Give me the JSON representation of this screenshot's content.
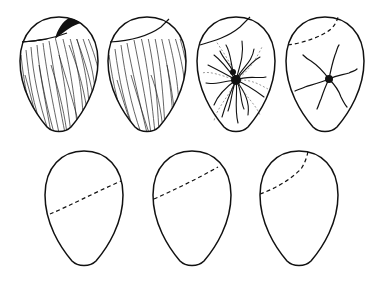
{
  "figure": {
    "stroke_color": "#111111",
    "background": "#ffffff",
    "top_row": [
      {
        "id": "egg-1",
        "feature": "striated surface with dark crescent at top cap"
      },
      {
        "id": "egg-2",
        "feature": "striated surface with cap line"
      },
      {
        "id": "egg-3",
        "feature": "large radiating aster with cap line"
      },
      {
        "id": "egg-4",
        "feature": "small aster with dashed cap line"
      }
    ],
    "bottom_row": [
      {
        "id": "egg-5",
        "feature": "outline with low dashed diagonal line"
      },
      {
        "id": "egg-6",
        "feature": "outline with middle dashed diagonal line"
      },
      {
        "id": "egg-7",
        "feature": "outline with high dashed diagonal line"
      }
    ]
  }
}
